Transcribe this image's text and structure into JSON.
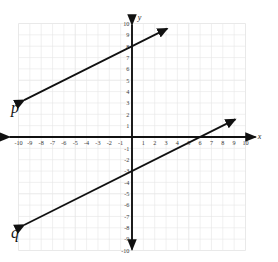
{
  "figure": {
    "title": "",
    "background_color": "#ffffff",
    "width": 278,
    "height": 262
  },
  "chart_data": {
    "type": "line",
    "title": "",
    "xlabel": "x",
    "ylabel": "y",
    "xlim": [
      -10,
      10
    ],
    "ylim": [
      -10,
      10
    ],
    "grid": true,
    "grid_step": 1,
    "legend_position": "inline-labels",
    "axis_color": "#111111",
    "grid_color": "#e6e6e6",
    "line_color": "#111111",
    "x_tick_labels": [
      "-10",
      "-9",
      "-8",
      "-7",
      "-6",
      "-5",
      "-4",
      "-3",
      "-2",
      "-1",
      "1",
      "2",
      "3",
      "4",
      "5",
      "6",
      "7",
      "8",
      "9",
      "10"
    ],
    "y_tick_labels": [
      "10",
      "9",
      "8",
      "7",
      "6",
      "5",
      "4",
      "3",
      "2",
      "1",
      "-1",
      "-2",
      "-3",
      "-4",
      "-5",
      "-6",
      "-7",
      "-8",
      "-9",
      "-10"
    ],
    "series": [
      {
        "name": "p",
        "label": "p",
        "slope": 0.5,
        "intercept": 8,
        "equation": "y = 0.5x + 8",
        "x_intercept": -16,
        "y_intercept": 8,
        "arrow_start": [
          -9.5,
          3.25
        ],
        "arrow_end": [
          3.1,
          9.55
        ],
        "label_position": [
          -10.3,
          2.1
        ],
        "points": [
          [
            -9.5,
            3.25
          ],
          [
            0,
            8
          ],
          [
            3.1,
            9.55
          ]
        ]
      },
      {
        "name": "q",
        "label": "q",
        "slope": 0.5,
        "intercept": -3,
        "equation": "y = 0.5x - 3",
        "x_intercept": 6,
        "y_intercept": -3,
        "arrow_start": [
          -9.5,
          -7.75
        ],
        "arrow_end": [
          9.1,
          1.55
        ],
        "label_position": [
          -10.3,
          -8.9
        ],
        "points": [
          [
            -9.5,
            -7.75
          ],
          [
            0,
            -3
          ],
          [
            6,
            0
          ],
          [
            9.1,
            1.55
          ]
        ]
      }
    ]
  }
}
